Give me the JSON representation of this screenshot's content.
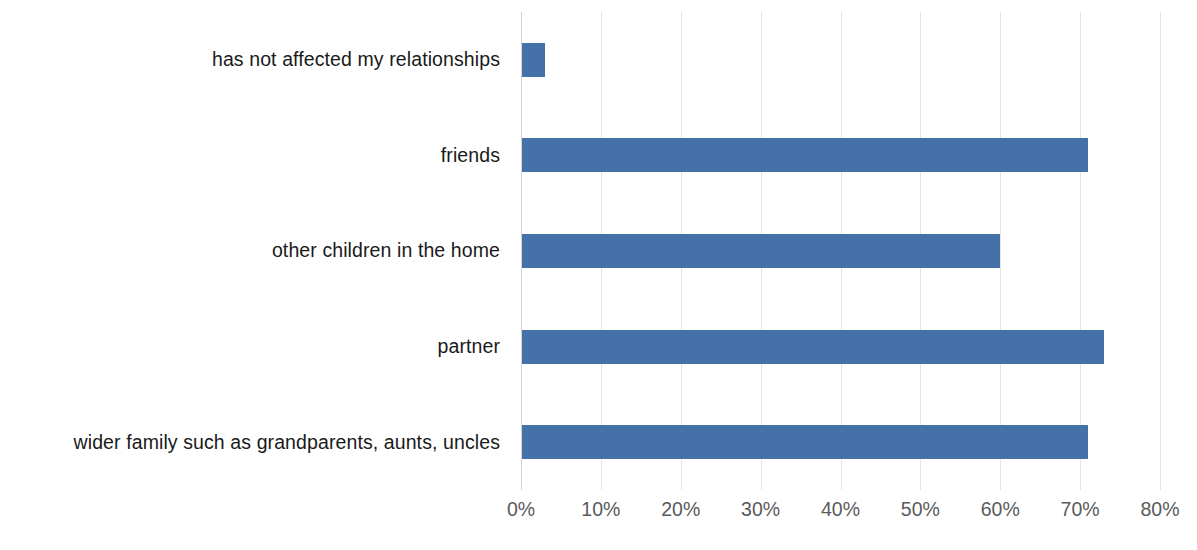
{
  "chart_data": {
    "type": "bar",
    "orientation": "horizontal",
    "title": "",
    "subtitle": "",
    "xlabel": "",
    "ylabel": "",
    "categories": [
      "has not affected my relationships",
      "friends",
      "other children in the home",
      "partner",
      "wider family such as grandparents, aunts, uncles"
    ],
    "values": [
      3,
      71,
      60,
      73,
      71
    ],
    "value_format": "percent",
    "xlim": [
      0,
      80
    ],
    "tick_labels": [
      "0%",
      "10%",
      "20%",
      "30%",
      "40%",
      "50%",
      "60%",
      "70%",
      "80%"
    ],
    "tick_values": [
      0,
      10,
      20,
      30,
      40,
      50,
      60,
      70,
      80
    ],
    "grid": true,
    "grid_axis": "x",
    "legend": false,
    "legend_position": "none",
    "series": [
      {
        "name": "",
        "values": [
          3,
          71,
          60,
          73,
          71
        ]
      }
    ],
    "colors": {
      "bar": "#4472a8",
      "gridline": "#e2e5e8",
      "axis_line": "#d0d4d8",
      "tick_label": "#5a5a5a",
      "category_label": "#1a1a1a",
      "background": "#ffffff"
    }
  }
}
